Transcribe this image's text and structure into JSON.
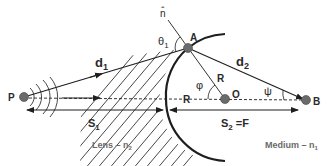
{
  "points": {
    "P": {
      "label": "P",
      "x": 24,
      "y": 97
    },
    "A": {
      "label": "A",
      "x": 188,
      "y": 48
    },
    "O": {
      "label": "O",
      "x": 225,
      "y": 99
    },
    "B": {
      "label": "B",
      "x": 306,
      "y": 100
    }
  },
  "labels": {
    "normal": "n̂",
    "theta1": "θ",
    "theta1_sub": "1",
    "d1": "d",
    "d1_sub": "1",
    "d2": "d",
    "d2_sub": "2",
    "R_radius": "R",
    "R_axis": "R",
    "phi": "φ",
    "psi": "ψ",
    "S1": "S",
    "S1_sub": "1",
    "S2": "S",
    "S2_sub": "2",
    "S2_eq": " =F",
    "lens": "Lens – n",
    "lens_sub": "2",
    "medium": "Medium – n",
    "medium_sub": "1"
  },
  "colors": {
    "line": "#1e1e1e",
    "point": "#6b6b6b",
    "hatch": "#333333",
    "text": "#2a2a2a",
    "muted_text": "#6a6a6a"
  }
}
